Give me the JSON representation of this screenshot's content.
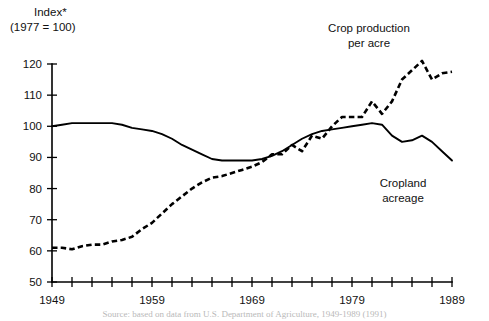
{
  "axis": {
    "y_unit_line1": "Index*",
    "y_unit_line2": "(1977 = 100)",
    "y_ticks": [
      50,
      60,
      70,
      80,
      90,
      100,
      110,
      120
    ],
    "y_min": 50,
    "y_max": 120,
    "x_min": 1949,
    "x_max": 1989,
    "x_labels": [
      "1949",
      "1959",
      "1969",
      "1979",
      "1989"
    ],
    "x_label_values": [
      1949,
      1959,
      1969,
      1979,
      1989
    ],
    "x_tick_step": 2
  },
  "labels": {
    "crop_production_line1": "Crop production",
    "crop_production_line2": "per acre",
    "cropland_line1": "Cropland",
    "cropland_line2": "acreage"
  },
  "footnote": {
    "text": "Source: based on data from U.S. Department of Agriculture, 1949-1989 (1991)"
  },
  "chart_data": {
    "type": "line",
    "title": "",
    "subtitle": "",
    "xlabel": "",
    "ylabel": "Index* (1977 = 100)",
    "xlim": [
      1949,
      1989
    ],
    "ylim": [
      50,
      120
    ],
    "grid": false,
    "legend": "inline-annotations",
    "x": [
      1949,
      1950,
      1951,
      1952,
      1953,
      1954,
      1955,
      1956,
      1957,
      1958,
      1959,
      1960,
      1961,
      1962,
      1963,
      1964,
      1965,
      1966,
      1967,
      1968,
      1969,
      1970,
      1971,
      1972,
      1973,
      1974,
      1975,
      1976,
      1977,
      1978,
      1979,
      1980,
      1981,
      1982,
      1983,
      1984,
      1985,
      1986,
      1987,
      1988,
      1989
    ],
    "series": [
      {
        "name": "Crop production per acre",
        "style": "dotted",
        "values": [
          61,
          61,
          60.5,
          61.5,
          62,
          62,
          63,
          63.5,
          64.5,
          67,
          69,
          72,
          75,
          77.5,
          80,
          82,
          83.5,
          84,
          85,
          86,
          87,
          88.5,
          91,
          91,
          94,
          92,
          97,
          96,
          100,
          103,
          103,
          103,
          108,
          104,
          108,
          115,
          118,
          121,
          115,
          117,
          117.5
        ]
      },
      {
        "name": "Cropland acreage",
        "style": "solid",
        "values": [
          100,
          100.5,
          101,
          101,
          101,
          101,
          101,
          100.5,
          99.5,
          99,
          98.5,
          97.5,
          96,
          94,
          92.5,
          91,
          89.5,
          89,
          89,
          89,
          89,
          89.5,
          90.5,
          92,
          94,
          96,
          97.5,
          98.5,
          99,
          99.5,
          100,
          100.5,
          101,
          100.5,
          97,
          95,
          95.5,
          97,
          95,
          92,
          89
        ]
      }
    ]
  }
}
